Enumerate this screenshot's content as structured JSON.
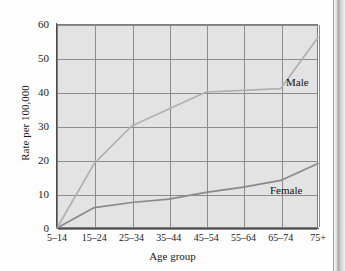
{
  "figure": {
    "background_color": "#e3e3e3",
    "grid_color": "#8c8c8c",
    "axis_color": "#4a4a4a"
  },
  "chart_data": {
    "type": "line",
    "title": "",
    "xlabel": "Age group",
    "ylabel": "Rate per 100,000",
    "categories": [
      "5–14",
      "15–24",
      "25–34",
      "35–44",
      "45–54",
      "55–64",
      "65–74",
      "75+"
    ],
    "yticks": [
      0,
      10,
      20,
      30,
      40,
      50,
      60
    ],
    "ylim": [
      0,
      60
    ],
    "grid": true,
    "legend_position": "inline-right",
    "series": [
      {
        "name": "Male",
        "color": "#b0b0b0",
        "values": [
          0,
          19,
          30,
          35,
          40,
          40.5,
          41,
          56
        ]
      },
      {
        "name": "Female",
        "color": "#8a8a8a",
        "values": [
          0,
          6,
          7.5,
          8.5,
          10.5,
          12,
          14,
          19
        ]
      }
    ]
  },
  "labels": {
    "male": "Male",
    "female": "Female"
  }
}
